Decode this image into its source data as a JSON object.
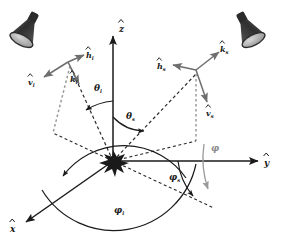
{
  "figure": {
    "type": "bistatic-scattering-geometry-diagram",
    "background_color": "#ffffff"
  },
  "colors": {
    "axis": "#1a1a1a",
    "dashed_ray": "#2a2a2a",
    "arc_black": "#1a1a1a",
    "arc_gray": "#9a9a9a",
    "vector_gray": "#6e6e6e",
    "source_body": "#3a3a3a",
    "source_dark": "#2b2b2b",
    "source_face": "#b8b8b8",
    "scatterer": "#1a1a1a"
  },
  "axes": [
    {
      "name": "z-axis",
      "label": "z",
      "hat": true,
      "label_x": 122,
      "label_y": 28
    },
    {
      "name": "y-axis",
      "label": "y",
      "hat": true,
      "label_x": 268,
      "label_y": 160
    },
    {
      "name": "x-axis",
      "label": "x",
      "hat": true,
      "label_x": 14,
      "label_y": 228
    }
  ],
  "sources": [
    {
      "name": "incident-source-cone",
      "role": "incident illumination source",
      "position": "upper-left",
      "aim": "down-right toward origin"
    },
    {
      "name": "scattered-detector-cone",
      "role": "scattered detection source",
      "position": "upper-right",
      "aim": "down-left toward origin"
    }
  ],
  "scatterer": {
    "name": "scattering-target",
    "label": "",
    "x": 113,
    "y": 161
  },
  "incident_frame": {
    "origin_x": 68,
    "origin_y": 62,
    "vectors": [
      {
        "name": "h-hat-i-vector",
        "label": "h",
        "sub": "i",
        "hat": true,
        "label_x": 88,
        "label_y": 56,
        "tip_x": 84,
        "tip_y": 56
      },
      {
        "name": "v-hat-i-vector",
        "label": "v",
        "sub": "i",
        "hat": true,
        "label_x": 30,
        "label_y": 82,
        "tip_x": 42,
        "tip_y": 76
      },
      {
        "name": "k-hat-i-vector",
        "label": "k",
        "sub": "i",
        "hat": true,
        "label_x": 72,
        "label_y": 80,
        "tip_x": 78,
        "tip_y": 82
      }
    ]
  },
  "scattered_frame": {
    "origin_x": 196,
    "origin_y": 70,
    "vectors": [
      {
        "name": "h-hat-s-vector",
        "label": "h",
        "sub": "s",
        "hat": true,
        "label_x": 160,
        "label_y": 67,
        "tip_x": 170,
        "tip_y": 70
      },
      {
        "name": "k-hat-s-vector",
        "label": "k",
        "sub": "s",
        "hat": true,
        "label_x": 222,
        "label_y": 50,
        "tip_x": 218,
        "tip_y": 54
      },
      {
        "name": "v-hat-s-vector",
        "label": "v",
        "sub": "s",
        "hat": true,
        "label_x": 208,
        "label_y": 112,
        "tip_x": 206,
        "tip_y": 104
      }
    ]
  },
  "angles": [
    {
      "name": "theta-i-angle",
      "label": "θ",
      "sub": "i",
      "description": "incident zenith angle from z-axis",
      "color": "#1a1a1a",
      "label_x": 97,
      "label_y": 88
    },
    {
      "name": "theta-s-angle",
      "label": "θ",
      "sub": "s",
      "description": "scattered zenith angle from z-axis",
      "color": "#1a1a1a",
      "label_x": 129,
      "label_y": 116
    },
    {
      "name": "phi-angle",
      "label": "φ",
      "sub": "",
      "description": "relative azimuth between incident and scattered planes",
      "color": "#9a9a9a",
      "label_x": 213,
      "label_y": 148
    },
    {
      "name": "phi-s-angle",
      "label": "φ",
      "sub": "s",
      "description": "scattered azimuth angle from y-axis",
      "color": "#1a1a1a",
      "label_x": 172,
      "label_y": 177
    },
    {
      "name": "phi-i-angle",
      "label": "φ",
      "sub": "i",
      "description": "incident azimuth angle from y-axis",
      "color": "#1a1a1a",
      "label_x": 117,
      "label_y": 210
    }
  ],
  "rays": [
    {
      "name": "incident-ray-dashed",
      "style": "dashed",
      "from": "incident-frame-origin",
      "to": "scatterer"
    },
    {
      "name": "scattered-ray-dashed",
      "style": "dashed",
      "from": "scatterer",
      "to": "scattered-frame-origin"
    },
    {
      "name": "incident-projection-drop",
      "style": "dashed",
      "description": "vertical drop to xy-plane"
    },
    {
      "name": "scattered-projection-drop",
      "style": "dashed",
      "description": "vertical drop to xy-plane"
    },
    {
      "name": "incident-ground-projection",
      "style": "dashed",
      "description": "projection of incident ray in xy-plane"
    },
    {
      "name": "scattered-ground-projection",
      "style": "dashed",
      "description": "projection of scattered ray in xy-plane"
    }
  ]
}
